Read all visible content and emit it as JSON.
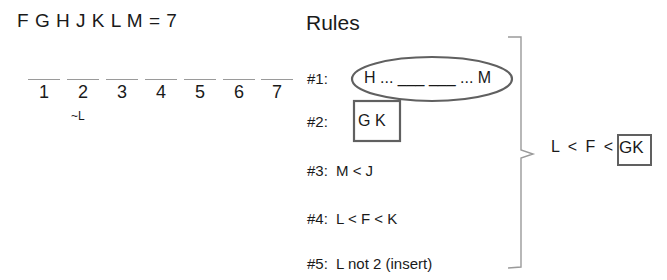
{
  "header": {
    "variables": "F G H J K L M = 7"
  },
  "slots": [
    {
      "label": "1",
      "note": ""
    },
    {
      "label": "2",
      "note": "~L"
    },
    {
      "label": "3",
      "note": ""
    },
    {
      "label": "4",
      "note": ""
    },
    {
      "label": "5",
      "note": ""
    },
    {
      "label": "6",
      "note": ""
    },
    {
      "label": "7",
      "note": ""
    }
  ],
  "rules": {
    "title": "Rules",
    "items": [
      {
        "id": "#1:",
        "text": "H ... ___ ___ ... M",
        "highlight": "ellipse"
      },
      {
        "id": "#2:",
        "text": "G K",
        "highlight": "box"
      },
      {
        "id": "#3:",
        "text": "M < J"
      },
      {
        "id": "#4:",
        "text": "L < F < K"
      },
      {
        "id": "#5:",
        "text": "L not 2 (insert)"
      }
    ]
  },
  "conclusion": {
    "prefix": "L < F <",
    "boxed": "GK"
  },
  "colors": {
    "text": "#1a1a1a",
    "shape_stroke": "#606060",
    "bracket": "#9a9a9a"
  }
}
